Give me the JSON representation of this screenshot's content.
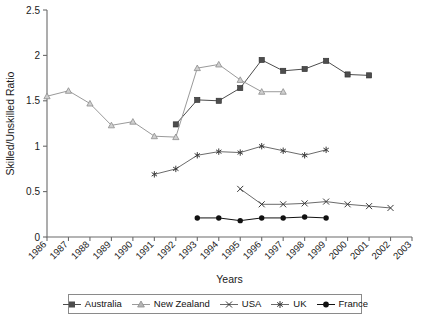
{
  "chart_data": {
    "type": "line",
    "title": "",
    "xlabel": "Years",
    "ylabel": "Skilled/Unskilled Ratio",
    "xlim": [
      1986,
      2003
    ],
    "ylim": [
      0,
      2.5
    ],
    "ytick_labels": [
      "0",
      "0.5",
      "1",
      "1.5",
      "2",
      "2.5"
    ],
    "ytick_values": [
      0,
      0.5,
      1,
      1.5,
      2,
      2.5
    ],
    "xtick_labels": [
      "1986",
      "1987",
      "1988",
      "1989",
      "1990",
      "1991",
      "1992",
      "1993",
      "1994",
      "1995",
      "1996",
      "1997",
      "1998",
      "1999",
      "2000",
      "2001",
      "2002",
      "2003"
    ],
    "grid": false,
    "legend_position": "bottom",
    "series": [
      {
        "name": "Australia",
        "marker": "square",
        "color": "#4d4d4d",
        "points": [
          {
            "x": 1992,
            "y": 1.24
          },
          {
            "x": 1993,
            "y": 1.51
          },
          {
            "x": 1994,
            "y": 1.5
          },
          {
            "x": 1995,
            "y": 1.64
          },
          {
            "x": 1996,
            "y": 1.95
          },
          {
            "x": 1997,
            "y": 1.83
          },
          {
            "x": 1998,
            "y": 1.85
          },
          {
            "x": 1999,
            "y": 1.94
          },
          {
            "x": 2000,
            "y": 1.79
          },
          {
            "x": 2001,
            "y": 1.78
          }
        ]
      },
      {
        "name": "New Zealand",
        "marker": "triangle",
        "color": "#9a9a9a",
        "points": [
          {
            "x": 1986,
            "y": 1.55
          },
          {
            "x": 1987,
            "y": 1.61
          },
          {
            "x": 1988,
            "y": 1.47
          },
          {
            "x": 1989,
            "y": 1.23
          },
          {
            "x": 1990,
            "y": 1.27
          },
          {
            "x": 1991,
            "y": 1.11
          },
          {
            "x": 1992,
            "y": 1.1
          },
          {
            "x": 1993,
            "y": 1.86
          },
          {
            "x": 1994,
            "y": 1.9
          },
          {
            "x": 1995,
            "y": 1.73
          },
          {
            "x": 1996,
            "y": 1.6
          },
          {
            "x": 1997,
            "y": 1.6
          }
        ]
      },
      {
        "name": "USA",
        "marker": "cross",
        "color": "#6b6b6b",
        "points": [
          {
            "x": 1995,
            "y": 0.53
          },
          {
            "x": 1996,
            "y": 0.36
          },
          {
            "x": 1997,
            "y": 0.36
          },
          {
            "x": 1998,
            "y": 0.37
          },
          {
            "x": 1999,
            "y": 0.39
          },
          {
            "x": 2000,
            "y": 0.36
          },
          {
            "x": 2001,
            "y": 0.34
          },
          {
            "x": 2002,
            "y": 0.32
          }
        ]
      },
      {
        "name": "UK",
        "marker": "asterisk",
        "color": "#6b6b6b",
        "points": [
          {
            "x": 1991,
            "y": 0.69
          },
          {
            "x": 1992,
            "y": 0.75
          },
          {
            "x": 1993,
            "y": 0.9
          },
          {
            "x": 1994,
            "y": 0.94
          },
          {
            "x": 1995,
            "y": 0.93
          },
          {
            "x": 1996,
            "y": 1.0
          },
          {
            "x": 1997,
            "y": 0.95
          },
          {
            "x": 1998,
            "y": 0.9
          },
          {
            "x": 1999,
            "y": 0.96
          }
        ]
      },
      {
        "name": "France",
        "marker": "circle",
        "color": "#111111",
        "points": [
          {
            "x": 1993,
            "y": 0.21
          },
          {
            "x": 1994,
            "y": 0.21
          },
          {
            "x": 1995,
            "y": 0.18
          },
          {
            "x": 1996,
            "y": 0.21
          },
          {
            "x": 1997,
            "y": 0.21
          },
          {
            "x": 1998,
            "y": 0.22
          },
          {
            "x": 1999,
            "y": 0.21
          }
        ]
      }
    ]
  },
  "legend": {
    "items": [
      {
        "label": "Australia"
      },
      {
        "label": "New Zealand"
      },
      {
        "label": "USA"
      },
      {
        "label": "UK"
      },
      {
        "label": "France"
      }
    ]
  }
}
